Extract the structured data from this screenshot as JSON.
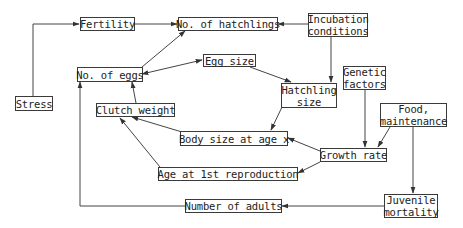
{
  "diagram": {
    "nodes": {
      "stress": {
        "label": "Stress"
      },
      "fertility": {
        "label": "Fertility"
      },
      "hatchlings": {
        "label": "No. of hatchlings"
      },
      "incubation": {
        "line1": "Incubation",
        "line2": "conditions"
      },
      "eggs": {
        "label": "No. of eggs"
      },
      "egg_size": {
        "label": "Egg size"
      },
      "hatchling_size": {
        "line1": "Hatchling",
        "line2": "size"
      },
      "genetic": {
        "line1": "Genetic",
        "line2": "factors"
      },
      "food": {
        "line1": "Food,",
        "line2": "maintenance"
      },
      "clutch": {
        "label": "Clutch weight"
      },
      "body_size": {
        "label": "Body size at age x"
      },
      "growth": {
        "label": "Growth rate"
      },
      "age_repro": {
        "label": "Age at 1st reproduction"
      },
      "adults": {
        "label": "Number of adults"
      },
      "juvenile": {
        "line1": "Juvenile",
        "line2": "mortality"
      }
    },
    "edges": [
      {
        "from": "Stress",
        "to": "Fertility"
      },
      {
        "from": "Fertility",
        "to": "No. of hatchlings"
      },
      {
        "from": "Incubation conditions",
        "to": "No. of hatchlings"
      },
      {
        "from": "Incubation conditions",
        "to": "Hatchling size"
      },
      {
        "from": "No. of eggs",
        "to": "No. of hatchlings"
      },
      {
        "from": "No. of eggs",
        "to": "Egg size",
        "bidirectional": true
      },
      {
        "from": "Egg size",
        "to": "Hatchling size"
      },
      {
        "from": "Hatchling size",
        "to": "Body size at age x"
      },
      {
        "from": "Clutch weight",
        "to": "No. of eggs"
      },
      {
        "from": "Body size at age x",
        "to": "Clutch weight"
      },
      {
        "from": "Age at 1st reproduction",
        "to": "Clutch weight"
      },
      {
        "from": "Growth rate",
        "to": "Body size at age x"
      },
      {
        "from": "Growth rate",
        "to": "Age at 1st reproduction"
      },
      {
        "from": "Genetic factors",
        "to": "Growth rate"
      },
      {
        "from": "Food, maintenance",
        "to": "Growth rate"
      },
      {
        "from": "Food, maintenance",
        "to": "Juvenile mortality"
      },
      {
        "from": "Juvenile mortality",
        "to": "Number of adults"
      },
      {
        "from": "Number of adults",
        "to": "No. of eggs"
      }
    ]
  }
}
